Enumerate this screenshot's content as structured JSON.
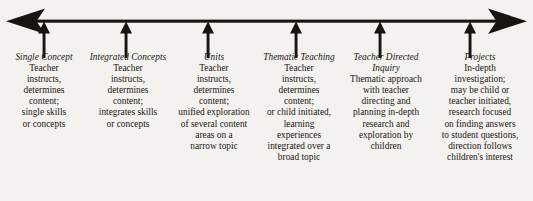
{
  "diagram": {
    "type": "continuum-arrow",
    "line_color": "#17150f",
    "background_color": "#f3f2ee",
    "axis": {
      "name": "horizontal-double-arrow",
      "left_arrowhead": "left-arrowhead",
      "right_arrowhead": "right-arrowhead",
      "tick_count": 6
    },
    "columns": [
      {
        "id": "single-concept",
        "header": "Single Concept",
        "body": "Teacher\ninstructs,\ndetermines\ncontent;\nsingle skills\nor concepts",
        "marker": "up-arrow-marker"
      },
      {
        "id": "integrated-concepts",
        "header": "Integrated Concepts",
        "body": "Teacher\ninstructs,\ndetermines\ncontent;\nintegrates skills\nor concepts",
        "marker": "up-arrow-marker"
      },
      {
        "id": "units",
        "header": "Units",
        "body": "Teacher\ninstructs,\ndetermines\ncontent;\nunified exploration\nof several content\nareas on a\nnarrow topic",
        "marker": "up-arrow-marker"
      },
      {
        "id": "thematic-teaching",
        "header": "Thematic Teaching",
        "body": "Teacher\ninstructs,\ndetermines\ncontent;\nor child initiated,\nlearning\nexperiences\nintegrated over a\nbroad topic",
        "marker": "up-arrow-marker"
      },
      {
        "id": "teacher-directed-inquiry",
        "header": "Teacher Directed\nInquiry",
        "body": "Thematic approach\nwith teacher\ndirecting and\nplanning in-depth\nresearch and\nexploration by\nchildren",
        "marker": "up-arrow-marker"
      },
      {
        "id": "projects",
        "header": "Projects",
        "body": "In-depth\ninvestigation;\nmay be child or\nteacher initiated,\nresearch focused\non finding answers\nto student questions,\ndirection follows\nchildren's interest",
        "marker": "up-arrow-marker"
      }
    ]
  }
}
